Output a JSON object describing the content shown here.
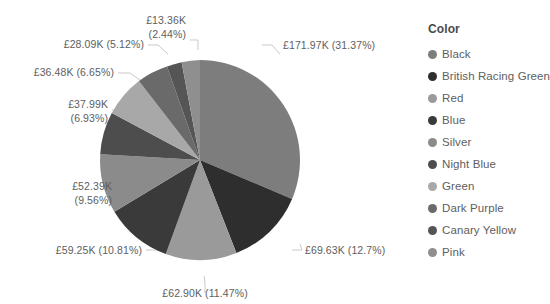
{
  "legend": {
    "title": "Color",
    "items": [
      {
        "label": "Black",
        "color": "#7d7d7d"
      },
      {
        "label": "British Racing Green",
        "color": "#2e2e2e"
      },
      {
        "label": "Red",
        "color": "#9a9a9a"
      },
      {
        "label": "Blue",
        "color": "#3a3a3a"
      },
      {
        "label": "Silver",
        "color": "#8b8b8b"
      },
      {
        "label": "Night Blue",
        "color": "#4d4d4d"
      },
      {
        "label": "Green",
        "color": "#a8a8a8"
      },
      {
        "label": "Dark Purple",
        "color": "#6a6a6a"
      },
      {
        "label": "Canary Yellow",
        "color": "#555555"
      },
      {
        "label": "Pink",
        "color": "#8f8f8f"
      }
    ]
  },
  "labels": {
    "black": {
      "value": "£171.97K (31.37%)"
    },
    "brgreen": {
      "value": "£69.63K (12.7%)"
    },
    "red": {
      "value": "£62.90K (11.47%)"
    },
    "blue": {
      "value": "£59.25K (10.81%)"
    },
    "silver": {
      "line1": "£52.39K",
      "line2": "(9.56%)"
    },
    "night": {
      "line1": "£37.99K",
      "line2": "(6.93%)"
    },
    "green": {
      "value": "£36.48K (6.65%)"
    },
    "purple": {
      "value": "£28.09K (5.12%)"
    },
    "canary": {
      "line1": "£13.36K",
      "line2": "(2.44%)"
    }
  },
  "chart_data": {
    "type": "pie",
    "title": "",
    "legend_position": "right",
    "legend_title": "Color",
    "value_prefix": "£",
    "value_suffix": "K",
    "categories": [
      "Black",
      "British Racing Green",
      "Red",
      "Blue",
      "Silver",
      "Night Blue",
      "Green",
      "Dark Purple",
      "Canary Yellow",
      "Pink"
    ],
    "values": [
      171.97,
      69.63,
      62.9,
      59.25,
      52.39,
      37.99,
      36.48,
      28.09,
      13.36,
      16.1
    ],
    "percents": [
      31.37,
      12.7,
      11.47,
      10.81,
      9.56,
      6.93,
      6.65,
      5.12,
      2.44,
      2.95
    ],
    "colors": [
      "#7d7d7d",
      "#2e2e2e",
      "#9a9a9a",
      "#3a3a3a",
      "#8b8b8b",
      "#4d4d4d",
      "#a8a8a8",
      "#6a6a6a",
      "#555555",
      "#8f8f8f"
    ],
    "labels": [
      "£171.97K (31.37%)",
      "£69.63K (12.7%)",
      "£62.90K (11.47%)",
      "£59.25K (10.81%)",
      "£52.39K (9.56%)",
      "£37.99K (6.93%)",
      "£36.48K (6.65%)",
      "£28.09K (5.12%)",
      "£13.36K (2.44%)",
      ""
    ],
    "start_angle_deg": 0,
    "direction": "clockwise"
  }
}
